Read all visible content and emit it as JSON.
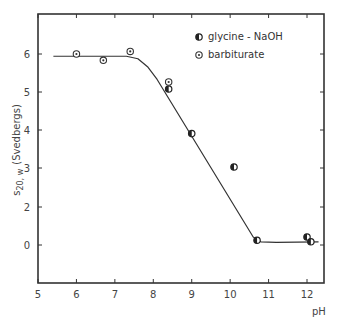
{
  "chart_data": {
    "type": "scatter",
    "title": "",
    "xlabel": "pH",
    "ylabel": "s20, w (Svedbergs)",
    "ylabel_main": "s",
    "ylabel_sub": "20, w",
    "ylabel_unit": "(Svedbergs)",
    "xlim": [
      5,
      12.5
    ],
    "ylim": [
      -1,
      7
    ],
    "x_ticks": [
      5,
      6,
      7,
      8,
      9,
      10,
      11,
      12
    ],
    "x_tick_labels": [
      "5",
      "6",
      "7",
      "8",
      "9",
      "10",
      "11",
      "12"
    ],
    "y_ticks": [
      0,
      2,
      3,
      4,
      5,
      6
    ],
    "y_tick_labels": [
      "0",
      "2",
      "3",
      "4",
      "5",
      "6"
    ],
    "grid": false,
    "legend_position": "upper right",
    "series": [
      {
        "name": "glycine - NaOH",
        "marker": "half-filled-circle",
        "points": [
          {
            "x": 8.4,
            "y": 4.9
          },
          {
            "x": 9.0,
            "y": 3.5
          },
          {
            "x": 10.1,
            "y": 2.45
          },
          {
            "x": 10.7,
            "y": 0.15
          },
          {
            "x": 12.0,
            "y": 0.25
          },
          {
            "x": 12.1,
            "y": 0.1
          }
        ]
      },
      {
        "name": "barbiturate",
        "marker": "dotted-circle",
        "points": [
          {
            "x": 6.0,
            "y": 6.0
          },
          {
            "x": 6.7,
            "y": 5.8
          },
          {
            "x": 7.4,
            "y": 6.08
          },
          {
            "x": 8.4,
            "y": 5.12
          }
        ]
      }
    ],
    "fit_curve": {
      "name": "fitted curve",
      "points": [
        {
          "x": 5.4,
          "y": 5.93
        },
        {
          "x": 7.3,
          "y": 5.93
        },
        {
          "x": 7.6,
          "y": 5.85
        },
        {
          "x": 7.85,
          "y": 5.6
        },
        {
          "x": 8.1,
          "y": 5.2
        },
        {
          "x": 10.6,
          "y": 0.25
        },
        {
          "x": 10.8,
          "y": 0.1
        },
        {
          "x": 11.2,
          "y": 0.08
        },
        {
          "x": 12.3,
          "y": 0.1
        }
      ]
    }
  }
}
